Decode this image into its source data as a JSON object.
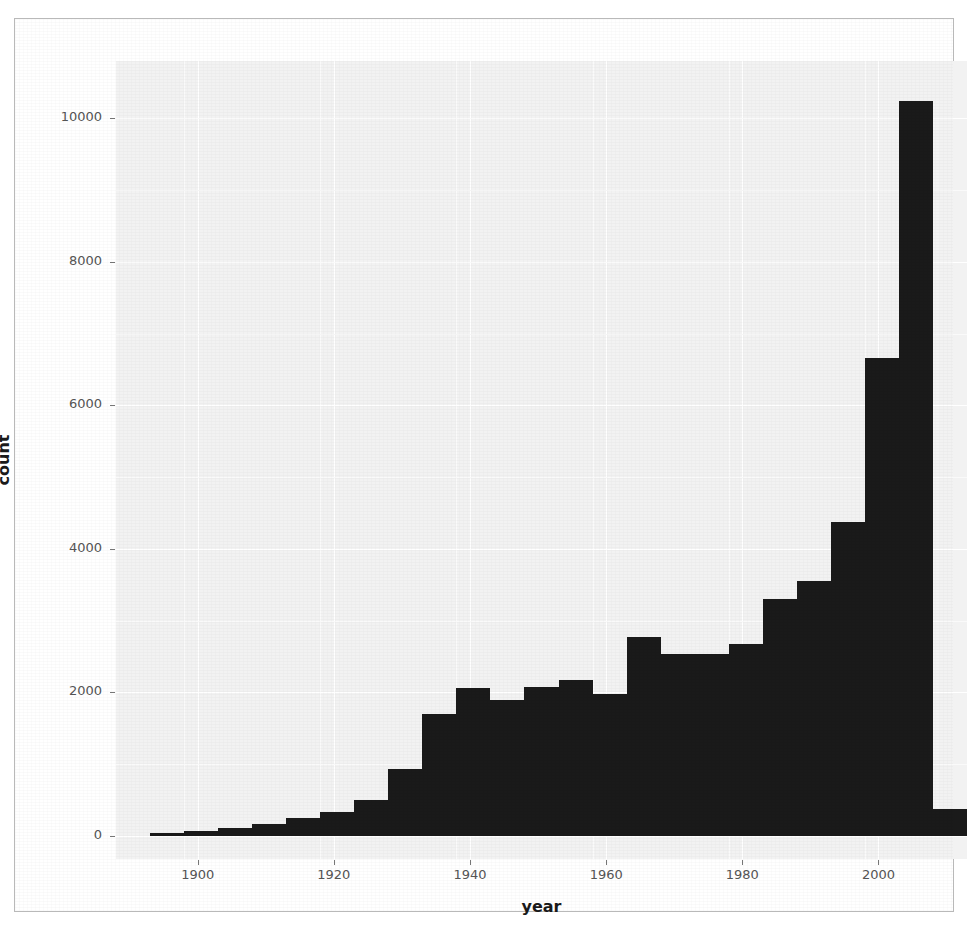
{
  "chart_data": {
    "type": "bar",
    "title": "",
    "subtitle": "",
    "xlabel": "year",
    "ylabel": "count",
    "xlim": [
      1888,
      2013
    ],
    "ylim": [
      0,
      10800
    ],
    "grid": true,
    "legend": null,
    "bin_width": 5,
    "bar_color": "#1a1a1a",
    "panel_color": "#f2f2f2",
    "x_ticks": [
      1900,
      1920,
      1940,
      1960,
      1980,
      2000
    ],
    "x_tick_labels": [
      "1900",
      "1920",
      "1940",
      "1960",
      "1980",
      "2000"
    ],
    "y_ticks": [
      0,
      2000,
      4000,
      6000,
      8000,
      10000
    ],
    "y_tick_labels": [
      "0",
      "2000",
      "4000",
      "6000",
      "8000",
      "10000"
    ],
    "categories": [
      "1893",
      "1898",
      "1903",
      "1908",
      "1913",
      "1918",
      "1923",
      "1928",
      "1933",
      "1938",
      "1943",
      "1948",
      "1953",
      "1958",
      "1963",
      "1968",
      "1973",
      "1978",
      "1983",
      "1988",
      "1993",
      "1998",
      "2003",
      "2008"
    ],
    "bin_starts": [
      1893,
      1898,
      1903,
      1908,
      1913,
      1918,
      1923,
      1928,
      1933,
      1938,
      1943,
      1948,
      1953,
      1958,
      1963,
      1968,
      1973,
      1978,
      1983,
      1988,
      1993,
      1998,
      2003,
      2008
    ],
    "values": [
      40,
      70,
      110,
      170,
      250,
      330,
      500,
      930,
      1700,
      2060,
      1900,
      2070,
      2180,
      1980,
      2780,
      2540,
      2540,
      2670,
      3300,
      3560,
      4370,
      6660,
      10240,
      380
    ]
  }
}
